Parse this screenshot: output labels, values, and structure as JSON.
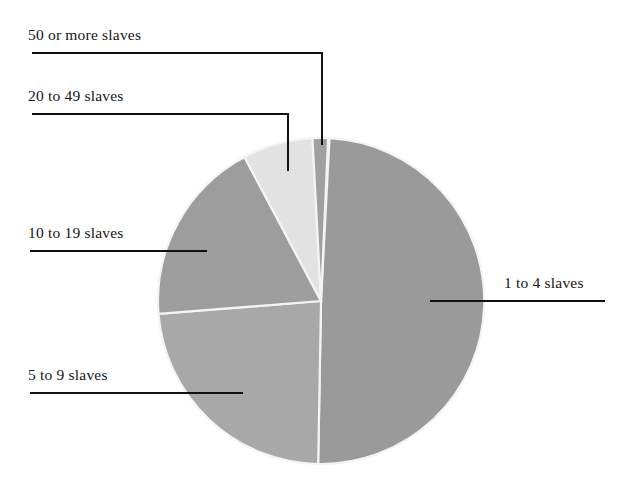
{
  "figure": {
    "type": "pie-chart",
    "background": "#ffffff"
  },
  "chart_data": {
    "type": "pie",
    "title": "",
    "subtitle": "",
    "xlabel": "",
    "ylabel": "",
    "legend_position": "callout-labels",
    "grid": false,
    "categories": [
      "1 to 4 slaves",
      "5 to 9 slaves",
      "10 to 19 slaves",
      "20 to 49 slaves",
      "50 or more slaves"
    ],
    "values": [
      49.5,
      23.5,
      18.5,
      7.0,
      1.5
    ],
    "units": "percent of slaveholders",
    "slices": [
      {
        "label": "1 to 4 slaves",
        "value": 49.5,
        "color": "#9a9a9a",
        "start_angle_deg": 3.0,
        "end_angle_deg": 181.0
      },
      {
        "label": "5 to 9 slaves",
        "value": 23.5,
        "color": "#a8a8a8",
        "start_angle_deg": 181.0,
        "end_angle_deg": 265.5
      },
      {
        "label": "10 to 19 slaves",
        "value": 18.5,
        "color": "#9d9d9d",
        "start_angle_deg": 265.5,
        "end_angle_deg": 332.0
      },
      {
        "label": "20 to 49 slaves",
        "value": 7.0,
        "color": "#e2e2e2",
        "start_angle_deg": 332.0,
        "end_angle_deg": 357.0
      },
      {
        "label": "50 or more slaves",
        "value": 1.5,
        "color": "#a0a0a0",
        "start_angle_deg": 357.0,
        "end_angle_deg": 362.5
      }
    ],
    "separator_color": "#f4f4f4"
  },
  "labels": {
    "fifty_or_more": "50 or more slaves",
    "twenty_to_fortynine": "20 to 49 slaves",
    "ten_to_nineteen": "10 to 19 slaves",
    "five_to_nine": "5 to 9 slaves",
    "one_to_four": "1 to 4 slaves"
  },
  "colors": {
    "slice_dark": "#9a9a9a",
    "slice_mid": "#a6a6a6",
    "slice_light": "#e2e2e2",
    "leader_line": "#111111",
    "text": "#161616"
  }
}
